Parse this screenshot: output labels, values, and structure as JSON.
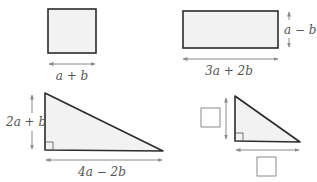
{
  "colors": {
    "outline": "#2b2b2b",
    "fill": "#f2f2f2",
    "arrow": "#8a8a8a",
    "label": "#555555",
    "answer_box": "#8a8a8a"
  },
  "shapes": {
    "square": {
      "side_label": "a + b"
    },
    "rectangle": {
      "width_label": "3a + 2b",
      "height_label": "a − b"
    },
    "triangle_large": {
      "height_label": "2a + b",
      "base_label": "4a − 2b"
    },
    "triangle_small": {
      "height_label": "",
      "base_label": ""
    }
  }
}
